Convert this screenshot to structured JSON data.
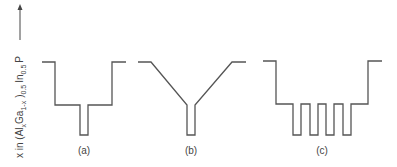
{
  "figure": {
    "axis_label": {
      "prefix": "x in (Al",
      "sub_x": "x",
      "ga": "Ga",
      "sub_1x": "1-x",
      "close": ")",
      "sub_05a": "0.5",
      "in": "In",
      "sub_05b": "0.5",
      "p": "P"
    },
    "panels": [
      {
        "label": "(a)",
        "description": "Single quantum well in separate confinement step"
      },
      {
        "label": "(b)",
        "description": "Single quantum well with graded-index (GRIN) confinement"
      },
      {
        "label": "(c)",
        "description": "Multiple quantum wells (4) in separate confinement step"
      }
    ],
    "line_color": "#555555"
  }
}
